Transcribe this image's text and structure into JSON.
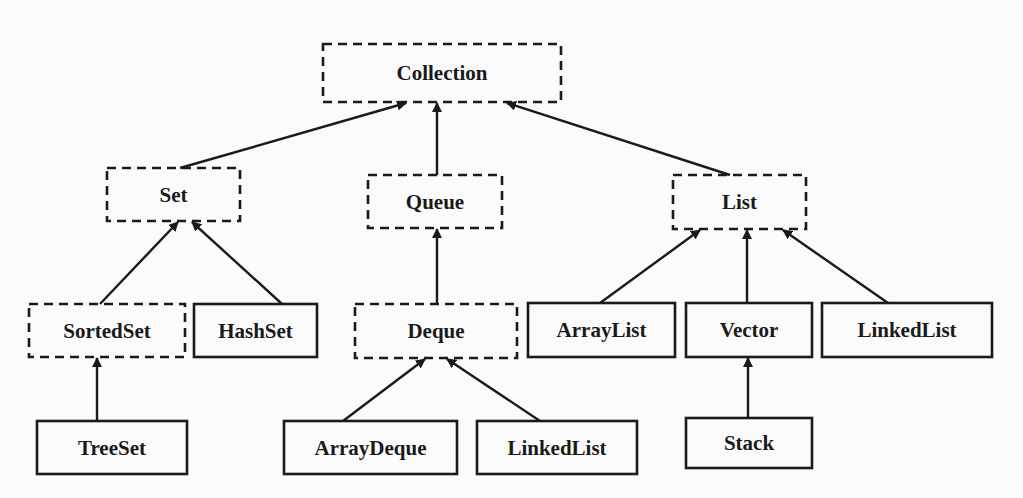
{
  "diagram": {
    "legend": {
      "dashed_box": "interface",
      "solid_box": "class",
      "arrow": "extends / implements (child → parent)"
    },
    "colors": {
      "stroke": "#1a1a1a",
      "text": "#1a1a1a",
      "background": "#fbfbfb"
    },
    "nodes": [
      {
        "id": "collection",
        "label": "Collection",
        "kind": "interface",
        "x": 323,
        "y": 44,
        "w": 238,
        "h": 58
      },
      {
        "id": "set",
        "label": "Set",
        "kind": "interface",
        "x": 107,
        "y": 168,
        "w": 133,
        "h": 53
      },
      {
        "id": "queue",
        "label": "Queue",
        "kind": "interface",
        "x": 368,
        "y": 175,
        "w": 134,
        "h": 53
      },
      {
        "id": "list",
        "label": "List",
        "kind": "interface",
        "x": 673,
        "y": 175,
        "w": 133,
        "h": 54
      },
      {
        "id": "sortedset",
        "label": "SortedSet",
        "kind": "interface",
        "x": 29,
        "y": 304,
        "w": 156,
        "h": 53
      },
      {
        "id": "hashset",
        "label": "HashSet",
        "kind": "class",
        "x": 194,
        "y": 304,
        "w": 123,
        "h": 53
      },
      {
        "id": "deque",
        "label": "Deque",
        "kind": "interface",
        "x": 355,
        "y": 304,
        "w": 162,
        "h": 54
      },
      {
        "id": "arraylist",
        "label": "ArrayList",
        "kind": "class",
        "x": 528,
        "y": 303,
        "w": 147,
        "h": 54
      },
      {
        "id": "vector",
        "label": "Vector",
        "kind": "class",
        "x": 686,
        "y": 303,
        "w": 126,
        "h": 54
      },
      {
        "id": "linkedlist_list",
        "label": "LinkedList",
        "kind": "class",
        "x": 822,
        "y": 303,
        "w": 170,
        "h": 54
      },
      {
        "id": "treeset",
        "label": "TreeSet",
        "kind": "class",
        "x": 37,
        "y": 421,
        "w": 150,
        "h": 53
      },
      {
        "id": "arraydeque",
        "label": "ArrayDeque",
        "kind": "class",
        "x": 284,
        "y": 421,
        "w": 173,
        "h": 53
      },
      {
        "id": "linkedlist_deque",
        "label": "LinkedList",
        "kind": "class",
        "x": 477,
        "y": 421,
        "w": 160,
        "h": 53
      },
      {
        "id": "stack",
        "label": "Stack",
        "kind": "class",
        "x": 686,
        "y": 418,
        "w": 126,
        "h": 50
      }
    ],
    "edges": [
      {
        "from": "set",
        "to": "collection",
        "x1": 180,
        "y1": 168,
        "x2": 406,
        "y2": 103
      },
      {
        "from": "queue",
        "to": "collection",
        "x1": 437,
        "y1": 175,
        "x2": 437,
        "y2": 103
      },
      {
        "from": "list",
        "to": "collection",
        "x1": 730,
        "y1": 175,
        "x2": 507,
        "y2": 103
      },
      {
        "from": "sortedset",
        "to": "set",
        "x1": 100,
        "y1": 304,
        "x2": 178,
        "y2": 222
      },
      {
        "from": "hashset",
        "to": "set",
        "x1": 282,
        "y1": 304,
        "x2": 192,
        "y2": 222
      },
      {
        "from": "deque",
        "to": "queue",
        "x1": 437,
        "y1": 304,
        "x2": 437,
        "y2": 229
      },
      {
        "from": "arraylist",
        "to": "list",
        "x1": 600,
        "y1": 303,
        "x2": 700,
        "y2": 230
      },
      {
        "from": "vector",
        "to": "list",
        "x1": 747,
        "y1": 303,
        "x2": 747,
        "y2": 230
      },
      {
        "from": "linkedlist_list",
        "to": "list",
        "x1": 888,
        "y1": 303,
        "x2": 783,
        "y2": 230
      },
      {
        "from": "treeset",
        "to": "sortedset",
        "x1": 97,
        "y1": 421,
        "x2": 97,
        "y2": 358
      },
      {
        "from": "arraydeque",
        "to": "deque",
        "x1": 343,
        "y1": 421,
        "x2": 425,
        "y2": 359
      },
      {
        "from": "linkedlist_deque",
        "to": "deque",
        "x1": 540,
        "y1": 421,
        "x2": 447,
        "y2": 359
      },
      {
        "from": "stack",
        "to": "vector",
        "x1": 748,
        "y1": 418,
        "x2": 748,
        "y2": 358
      }
    ]
  }
}
